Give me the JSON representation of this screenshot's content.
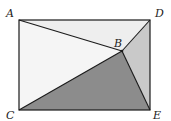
{
  "diagram": {
    "points": {
      "A": {
        "label": "A",
        "x": 19,
        "y": 20
      },
      "D": {
        "label": "D",
        "x": 150,
        "y": 20
      },
      "C": {
        "label": "C",
        "x": 19,
        "y": 110
      },
      "E": {
        "label": "E",
        "x": 150,
        "y": 110
      },
      "B": {
        "label": "B",
        "x": 122,
        "y": 51
      }
    },
    "regions": [
      {
        "name": "triangle-ADB",
        "color": "#eeeeee"
      },
      {
        "name": "triangle-ABC",
        "color": "#f5f5f5"
      },
      {
        "name": "triangle-DBE",
        "color": "#c9c9c9"
      },
      {
        "name": "triangle-CBE",
        "color": "#8c8c8c"
      }
    ],
    "stroke_color": "#1a1a1a"
  }
}
